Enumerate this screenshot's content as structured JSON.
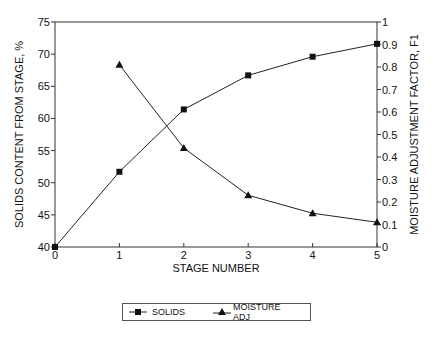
{
  "chart_data": {
    "type": "line",
    "title": "",
    "xlabel": "STAGE NUMBER",
    "ylabel_left": "SOLIDS CONTENT FROM STAGE, %",
    "ylabel_right": "MOISTURE ADJUSTMENT FACTOR, F1",
    "x_ticks": [
      0,
      1,
      2,
      3,
      4,
      5
    ],
    "y_left_ticks": [
      40,
      45,
      50,
      55,
      60,
      65,
      70,
      75
    ],
    "y_right_ticks": [
      0,
      0.1,
      0.2,
      0.3,
      0.4,
      0.5,
      0.6,
      0.7,
      0.8,
      0.9,
      1
    ],
    "xlim": [
      0,
      5
    ],
    "ylim_left": [
      40,
      75
    ],
    "ylim_right": [
      0,
      1
    ],
    "grid": false,
    "legend_position": "bottom",
    "series": [
      {
        "name": "SOLIDS",
        "axis": "left",
        "marker": "square",
        "x": [
          0,
          1,
          2,
          3,
          4,
          5
        ],
        "values": [
          40,
          51.7,
          61.4,
          66.7,
          69.6,
          71.6
        ]
      },
      {
        "name": "MOISTURE ADJ",
        "axis": "right",
        "marker": "triangle",
        "x": [
          1,
          2,
          3,
          4,
          5
        ],
        "values": [
          0.81,
          0.44,
          0.23,
          0.15,
          0.11
        ]
      }
    ]
  },
  "legend": {
    "solids_label": "SOLIDS",
    "moisture_label": "MOISTURE ADJ"
  }
}
